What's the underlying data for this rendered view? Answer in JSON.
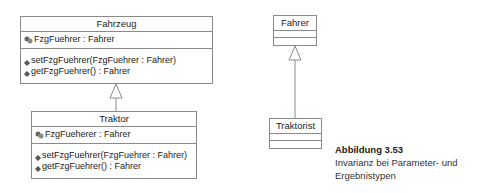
{
  "diagram": {
    "classes": {
      "fahrzeug": {
        "name": "Fahrzeug",
        "attributes": [
          {
            "text": "FzgFuehrer : Fahrer",
            "icon": "attribute-icon"
          }
        ],
        "operations": [
          {
            "text": "setFzgFuehrer(FzgFuehrer : Fahrer)",
            "icon": "operation-icon"
          },
          {
            "text": "getFzgFuehrer() : Fahrer",
            "icon": "operation-icon"
          }
        ]
      },
      "traktor": {
        "name": "Traktor",
        "attributes": [
          {
            "text": "FzgFueherer : Fahrer",
            "icon": "attribute-icon"
          }
        ],
        "operations": [
          {
            "text": "setFzgFuehrer(FzgFuehrer : Fahrer)",
            "icon": "operation-icon"
          },
          {
            "text": "getFzgFuehrer() : Fahrer",
            "icon": "operation-icon"
          }
        ]
      },
      "fahrer": {
        "name": "Fahrer",
        "attributes": [],
        "operations": []
      },
      "traktorist": {
        "name": "Traktorist",
        "attributes": [],
        "operations": []
      }
    },
    "relations": [
      {
        "type": "generalization",
        "from": "Traktor",
        "to": "Fahrzeug"
      },
      {
        "type": "generalization",
        "from": "Traktorist",
        "to": "Fahrer"
      }
    ]
  },
  "caption": {
    "title": "Abbildung 3.53",
    "line1": "Invarianz bei Parameter- und",
    "line2": "Ergebnistypen"
  },
  "colors": {
    "line": "#8a8a8a",
    "icon": "#555555"
  }
}
